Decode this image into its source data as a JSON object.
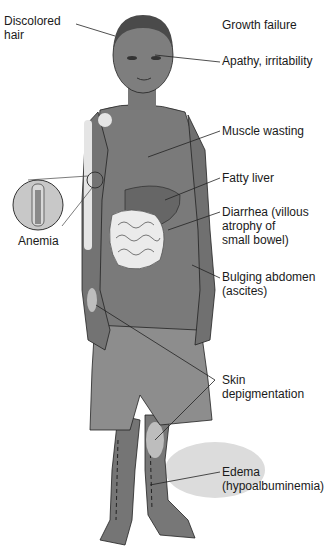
{
  "figure": {
    "colors": {
      "skin": "#7a7a7a",
      "skin_dark": "#5e5e5e",
      "hair": "#4a4a4a",
      "shorts": "#8c8c8c",
      "depigment": "#b8b8b8",
      "intestine": "#e8e8e8",
      "line": "#222222",
      "shadow": "#d6d6d6"
    }
  },
  "labels": {
    "discolored_hair": "Discolored\nhair",
    "growth_failure": "Growth failure",
    "apathy": "Apathy, irritability",
    "muscle_wasting": "Muscle wasting",
    "fatty_liver": "Fatty liver",
    "diarrhea": "Diarrhea (villous\natrophy of\nsmall bowel)",
    "anemia": "Anemia",
    "bulging_abdomen": "Bulging abdomen\n(ascites)",
    "skin_depigmentation": "Skin\ndepigmentation",
    "edema": "Edema\n(hypoalbuminemia)"
  }
}
